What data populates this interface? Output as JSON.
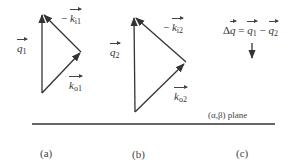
{
  "diagram": {
    "panels": [
      {
        "caption": "(a)",
        "labels": {
          "q": {
            "sym": "q",
            "sub": "1"
          },
          "ki": {
            "prefix": "− ",
            "sym": "k",
            "sub": "i1"
          },
          "ko": {
            "sym": "k",
            "sub": "o1"
          }
        },
        "vertices": {
          "apex": [
            42,
            13
          ],
          "right": [
            81,
            52
          ],
          "bottom": [
            42,
            93
          ]
        }
      },
      {
        "caption": "(b)",
        "labels": {
          "q": {
            "sym": "q",
            "sub": "2"
          },
          "ki": {
            "prefix": "− ",
            "sym": "k",
            "sub": "i2"
          },
          "ko": {
            "sym": "k",
            "sub": "o2"
          }
        },
        "vertices": {
          "apex": [
            134,
            16
          ],
          "right": [
            186,
            62
          ],
          "bottom": [
            135,
            112
          ]
        }
      },
      {
        "caption": "(c)",
        "equation": {
          "lhs_prefix": "Δ",
          "lhs": "q",
          "eq": " = ",
          "t1": "q",
          "t1_sub": "1",
          "minus": " − ",
          "t2": "q",
          "t2_sub": "2"
        }
      }
    ],
    "plane_label": "(α,β) plane",
    "colors": {
      "line": "#333333",
      "text": "#333333",
      "background": "#ffffff"
    }
  }
}
